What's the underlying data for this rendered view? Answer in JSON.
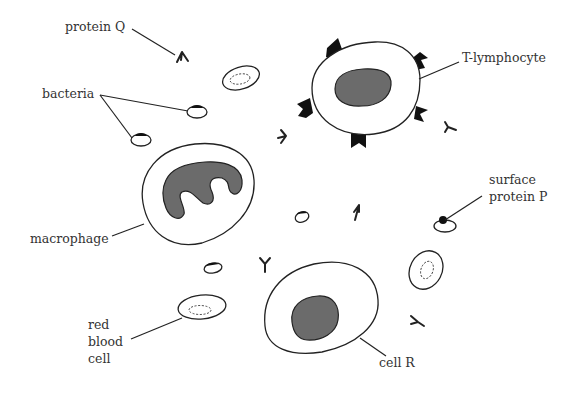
{
  "diagram": {
    "type": "biology-immune-cells",
    "labels": {
      "protein_q": "protein Q",
      "bacteria": "bacteria",
      "t_lymphocyte": "T-lymphocyte",
      "macrophage": "macrophage",
      "surface_protein_p_line1": "surface",
      "surface_protein_p_line2": "protein P",
      "red_blood_cell_line1": "red",
      "red_blood_cell_line2": "blood",
      "red_blood_cell_line3": "cell",
      "cell_r": "cell R"
    },
    "elements": [
      {
        "name": "T-lymphocyte",
        "shape": "rounded cell with dark nucleus and 6 surface receptors"
      },
      {
        "name": "macrophage",
        "shape": "large cell with E-shaped lobed nucleus"
      },
      {
        "name": "cell R",
        "shape": "large oval cell with dark oval nucleus"
      },
      {
        "name": "red blood cell",
        "count": 3,
        "shape": "small oval with dashed inner ellipse"
      },
      {
        "name": "bacteria",
        "count": 4,
        "shape": "small oval with dark cap"
      },
      {
        "name": "protein Q",
        "count": 6,
        "shape": "Y-shaped antibody"
      },
      {
        "name": "surface protein P",
        "shape": "black dot on bacterium"
      }
    ],
    "colors": {
      "nucleus": "#6b6b6b",
      "outline": "#222222",
      "receptor": "#111111",
      "text": "#333333"
    }
  }
}
